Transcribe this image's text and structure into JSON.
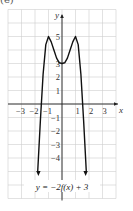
{
  "header": {
    "clipped_label": "(e)"
  },
  "chart_data": {
    "type": "line",
    "title": "",
    "equation": "y = −2f(x) + 3",
    "xlabel": "x",
    "ylabel": "y",
    "xlim": [
      -4,
      4
    ],
    "ylim": [
      -7,
      7
    ],
    "grid": true,
    "x_tick_labels": [
      "−3",
      "−2",
      "−1",
      "1",
      "2",
      "3"
    ],
    "x_ticks": [
      -3,
      -2,
      -1,
      1,
      2,
      3
    ],
    "y_tick_labels": [
      "5",
      "3",
      "2",
      "1",
      "−1",
      "−2",
      "−3",
      "−4"
    ],
    "y_ticks": [
      5,
      3,
      2,
      1,
      -1,
      -2,
      -3,
      -4
    ],
    "key_points": [
      {
        "x": -1,
        "y": 5,
        "note": "local max"
      },
      {
        "x": 0,
        "y": 3,
        "note": "local min"
      },
      {
        "x": 1,
        "y": 5,
        "note": "local max"
      }
    ],
    "series": [
      {
        "name": "y = −2f(x) + 3",
        "x": [
          -1.8,
          -1.6,
          -1.4,
          -1.2,
          -1.0,
          -0.8,
          -0.6,
          -0.4,
          -0.2,
          0,
          0.2,
          0.4,
          0.6,
          0.8,
          1.0,
          1.2,
          1.4,
          1.6,
          1.8
        ],
        "y": [
          -5,
          -1.2,
          2.2,
          4.4,
          5,
          4.6,
          4.0,
          3.4,
          3.05,
          3,
          3.05,
          3.4,
          4.0,
          4.6,
          5,
          4.4,
          2.2,
          -1.2,
          -5
        ],
        "end_arrows": "both ends point downward"
      }
    ],
    "colors": {
      "curve": "#111111",
      "axes": "#222222",
      "grid": "#cfcfcf"
    }
  }
}
